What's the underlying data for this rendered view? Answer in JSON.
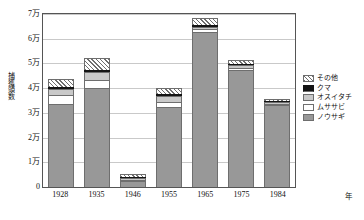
{
  "chart_data": {
    "type": "bar",
    "title": "",
    "subtitle": "",
    "xlabel": "年",
    "ylabel": "捕獲頭数",
    "stacked": true,
    "grid": true,
    "legend_position": "right",
    "categories": [
      "1928",
      "1935",
      "1946",
      "1955",
      "1965",
      "1975",
      "1984"
    ],
    "ylim": [
      0,
      70000
    ],
    "ytick_values": [
      0,
      10000,
      20000,
      30000,
      40000,
      50000,
      60000,
      70000
    ],
    "ytick_labels": [
      "0",
      "1万",
      "2万",
      "3万",
      "4万",
      "5万",
      "6万",
      "7万"
    ],
    "xtick_labels": [
      "1928",
      "1935",
      "1946",
      "1955",
      "1965",
      "1975",
      "1984"
    ],
    "series": [
      {
        "name": "ノウサギ",
        "color": "#989898",
        "pattern": "solid-gray",
        "values": [
          33500,
          40200,
          2300,
          32200,
          62900,
          47500,
          33000
        ]
      },
      {
        "name": "ムササビ",
        "color": "#ffffff",
        "pattern": "white",
        "values": [
          3900,
          3000,
          500,
          2400,
          900,
          500,
          400
        ]
      },
      {
        "name": "オスイタチ",
        "color": "#c9c9c9",
        "pattern": "light-gray",
        "values": [
          2400,
          3500,
          700,
          2300,
          1100,
          1100,
          700
        ]
      },
      {
        "name": "クマ",
        "color": "#141414",
        "pattern": "black",
        "values": [
          700,
          500,
          200,
          300,
          400,
          300,
          200
        ]
      },
      {
        "name": "その他",
        "color": "#ffffff",
        "pattern": "diagonal-hatch",
        "values": [
          3300,
          5000,
          900,
          2600,
          2800,
          1400,
          700
        ]
      }
    ],
    "totals": [
      43800,
      52200,
      4600,
      39800,
      68100,
      50800,
      35000
    ]
  },
  "axis": {
    "y_title": "捕獲頭数",
    "x_unit": "年"
  },
  "legend": {
    "items": [
      {
        "label": "その他",
        "swatch": "hatch-swatch"
      },
      {
        "label": "クマ",
        "swatch": "black-swatch"
      },
      {
        "label": "オスイタチ",
        "swatch": "lightgray-swatch"
      },
      {
        "label": "ムササビ",
        "swatch": "white-swatch"
      },
      {
        "label": "ノウサギ",
        "swatch": "gray-swatch"
      }
    ]
  }
}
